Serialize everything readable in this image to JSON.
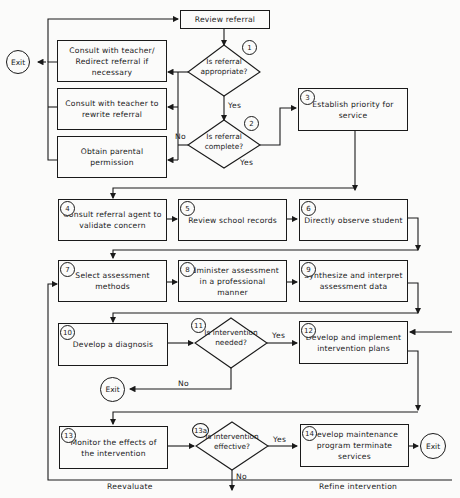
{
  "diagram": {
    "type": "flowchart",
    "nodes": {
      "review": {
        "label": "Review referral"
      },
      "consult_redirect": {
        "label": "Consult with teacher/ Redirect referral if necessary"
      },
      "consult_rewrite": {
        "label": "Consult with teacher to rewrite referral"
      },
      "parental": {
        "label": "Obtain parental permission"
      },
      "d1": {
        "num": "1",
        "label": "Is referral appropriate?"
      },
      "d2": {
        "num": "2",
        "label": "Is referral complete?"
      },
      "n3": {
        "num": "3",
        "label": "Establish priority for service"
      },
      "n4": {
        "num": "4",
        "label": "Consult referral agent to validate concern"
      },
      "n5": {
        "num": "5",
        "label": "Review school records"
      },
      "n6": {
        "num": "6",
        "label": "Directly observe student"
      },
      "n7": {
        "num": "7",
        "label": "Select assessment methods"
      },
      "n8": {
        "num": "8",
        "label": "Administer assessment in a professional manner"
      },
      "n9": {
        "num": "9",
        "label": "Synthesize and interpret assessment data"
      },
      "n10": {
        "num": "10",
        "label": "Develop a diagnosis"
      },
      "d11": {
        "num": "11",
        "label": "Is intervention needed?"
      },
      "n12": {
        "num": "12",
        "label": "Develop and implement intervention plans"
      },
      "n13": {
        "num": "13",
        "label": "Monitor the effects of the intervention"
      },
      "d13a": {
        "num": "13a",
        "label": "Is intervention effective?"
      },
      "n14": {
        "num": "14",
        "label": "Develop maintenance program terminate services"
      },
      "exit": {
        "label": "Exit"
      }
    },
    "edge_labels": {
      "yes": "Yes",
      "no": "No",
      "reevaluate": "Reevaluate",
      "refine": "Refine intervention"
    }
  }
}
